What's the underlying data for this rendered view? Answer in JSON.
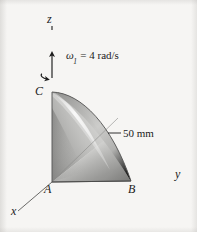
{
  "figure": {
    "type": "engineering-mechanics-diagram",
    "background_color": "#f6f5f3",
    "ink_color": "#1b1b1b"
  },
  "axes": {
    "z": {
      "label": "z",
      "direction": "up",
      "x": 50,
      "y": 20
    },
    "y": {
      "label": "y",
      "direction": "right",
      "x": 178,
      "y": 174
    },
    "x": {
      "label": "x",
      "direction": "lower-left",
      "x": 13,
      "y": 211
    }
  },
  "points": [
    {
      "label": "C",
      "x": 38,
      "y": 88,
      "description": "top of cone base on z axis"
    },
    {
      "label": "A",
      "x": 46,
      "y": 186,
      "description": "apex of cone at origin"
    },
    {
      "label": "B",
      "x": 131,
      "y": 187,
      "description": "base rim of cone on y axis"
    }
  ],
  "annotations": {
    "angular_velocity": {
      "symbol": "ω",
      "subscript": "1",
      "equals": "=",
      "value": "4",
      "units": "rad/s",
      "full_text": "ω₁ = 4 rad/s",
      "x": 66,
      "y": 56
    },
    "dimension": {
      "value": "50",
      "units": "mm",
      "full_text": "50 mm",
      "x": 124,
      "y": 135,
      "describes": "cone base radius"
    }
  },
  "shading": {
    "cone_light": "#fcfcfb",
    "cone_mid": "#b9b9b7",
    "cone_dark": "#8b8b89",
    "cone_darkest": "#6f6f6d",
    "base_light": "#e8e8e6",
    "base_dark": "#9a9a98"
  }
}
